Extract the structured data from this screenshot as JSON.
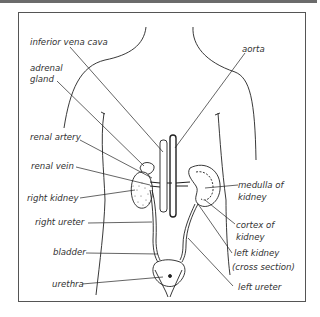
{
  "diagram": {
    "type": "anatomical illustration",
    "labels": {
      "inferior_vena_cava": "inferior vena cava",
      "aorta": "aorta",
      "adrenal_gland_1": "adrenal",
      "adrenal_gland_2": "gland",
      "renal_artery": "renal artery",
      "renal_vein": "renal vein",
      "right_kidney": "right kidney",
      "right_ureter": "right ureter",
      "bladder": "bladder",
      "urethra": "urethra",
      "medulla_1": "medulla of",
      "medulla_2": "kidney",
      "cortex_1": "cortex of",
      "cortex_2": "kidney",
      "left_kidney_1": "left kidney",
      "left_kidney_2": "(cross section)",
      "left_ureter": "left ureter"
    }
  }
}
